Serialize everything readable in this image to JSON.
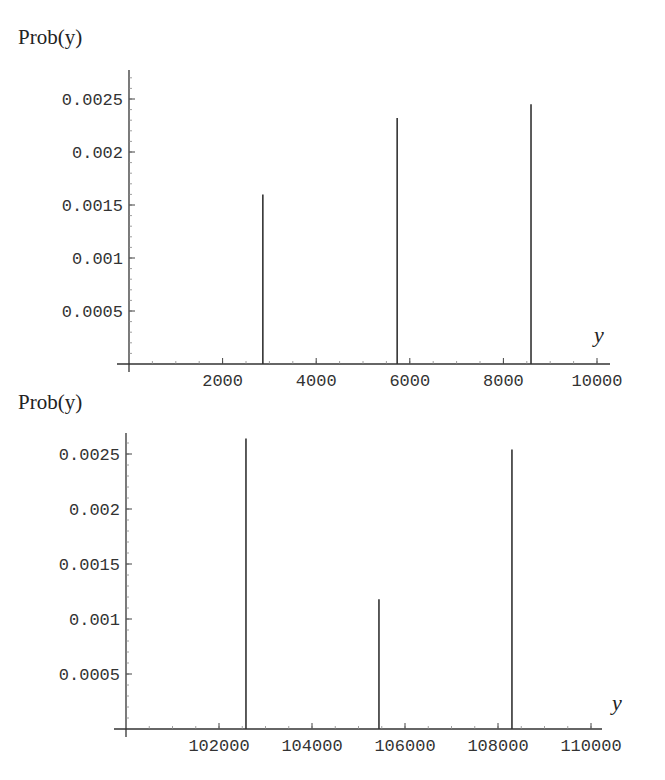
{
  "chart_data": [
    {
      "type": "bar",
      "subtype": "stem/spike plot",
      "title": "",
      "ylabel": "Prob(y)",
      "xlabel": "y",
      "xlim": [
        0,
        10300
      ],
      "ylim": [
        0,
        0.0028
      ],
      "x_ticks": [
        2000,
        4000,
        6000,
        8000,
        10000
      ],
      "x_tick_labels": [
        "2000",
        "4000",
        "6000",
        "8000",
        "10000"
      ],
      "y_ticks": [
        0.0005,
        0.001,
        0.0015,
        0.002,
        0.0025
      ],
      "y_tick_labels": [
        "0.0005",
        "0.001",
        "0.0015",
        "0.002",
        "0.0025"
      ],
      "grid": false,
      "legend": null,
      "x": [
        2860,
        5730,
        8590
      ],
      "values": [
        0.0016,
        0.00232,
        0.00245
      ]
    },
    {
      "type": "bar",
      "subtype": "stem/spike plot",
      "title": "",
      "ylabel": "Prob(y)",
      "xlabel": "y",
      "xlim": [
        100000,
        110250
      ],
      "ylim": [
        0,
        0.0027
      ],
      "x_ticks": [
        102000,
        104000,
        106000,
        108000,
        110000
      ],
      "x_tick_labels": [
        "102000",
        "104000",
        "106000",
        "108000",
        "110000"
      ],
      "y_ticks": [
        0.0005,
        0.001,
        0.0015,
        0.002,
        0.0025
      ],
      "y_tick_labels": [
        "0.0005",
        "0.001",
        "0.0015",
        "0.002",
        "0.0025"
      ],
      "grid": false,
      "legend": null,
      "x": [
        102580,
        105440,
        108300
      ],
      "values": [
        0.00264,
        0.00118,
        0.00254
      ]
    }
  ],
  "layout": [
    {
      "origin_px": [
        129,
        364
      ],
      "x_px_per_unit": 0.0468,
      "y_px_per_unit": 106000,
      "x_axis_end_px": 610,
      "y_axis_top_px": 70,
      "ylabel_pos": [
        18,
        44
      ],
      "xlabel_pos": [
        594,
        342
      ],
      "minor_x_step": 500,
      "minor_y_step": 0.0001
    },
    {
      "origin_px": [
        126,
        729
      ],
      "x_px_per_unit": 0.0465,
      "y_px_per_unit": 110000,
      "x_axis_end_px": 602,
      "y_axis_top_px": 433,
      "ylabel_pos": [
        18,
        409
      ],
      "xlabel_pos": [
        612,
        710
      ],
      "minor_x_step": 500,
      "minor_y_step": 0.0001
    }
  ]
}
